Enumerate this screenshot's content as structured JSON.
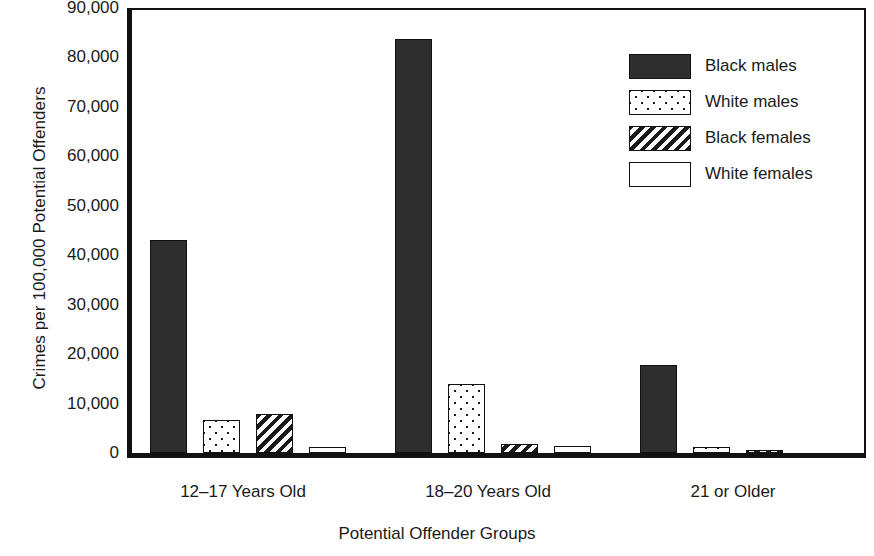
{
  "chart_data": {
    "type": "bar",
    "title": "",
    "xlabel": "Potential Offender Groups",
    "ylabel": "Crimes per 100,000 Potential Offenders",
    "categories": [
      "12–17 Years Old",
      "18–20 Years Old",
      "21 or Older"
    ],
    "ylim": [
      0,
      90000
    ],
    "yticks": [
      0,
      10000,
      20000,
      30000,
      40000,
      50000,
      60000,
      70000,
      80000,
      90000
    ],
    "ytick_labels": [
      "0",
      "10,000",
      "20,000",
      "30,000",
      "40,000",
      "50,000",
      "60,000",
      "70,000",
      "80,000",
      "90,000"
    ],
    "grid": false,
    "legend_position": "top-right",
    "series": [
      {
        "name": "Black males",
        "fill": "solid-dark",
        "color": "#2e2e2e",
        "values": [
          43000,
          83700,
          17800
        ]
      },
      {
        "name": "White males",
        "fill": "dotted",
        "color": "#ffffff",
        "values": [
          6700,
          13900,
          1300
        ]
      },
      {
        "name": "Black females",
        "fill": "diagonal-hatch",
        "color": "#ffffff",
        "values": [
          7800,
          1900,
          700
        ]
      },
      {
        "name": "White females",
        "fill": "plain-white",
        "color": "#ffffff",
        "values": [
          1300,
          1400,
          0
        ]
      }
    ]
  },
  "legend": {
    "items": [
      {
        "label": "Black males",
        "swatch": "solid-dark-swatch"
      },
      {
        "label": "White males",
        "swatch": "dotted-swatch"
      },
      {
        "label": "Black females",
        "swatch": "hatched-swatch"
      },
      {
        "label": "White females",
        "swatch": "plain-swatch"
      }
    ]
  }
}
